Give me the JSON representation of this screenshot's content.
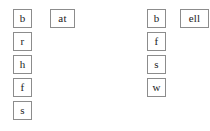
{
  "canvas": {
    "width": 210,
    "height": 131,
    "background_color": "#ffffff",
    "tile_border_color": "#8c8c8c",
    "tile_fill_color": "#ffffff",
    "text_color": "#1a1a1a"
  },
  "groups": [
    {
      "name": "at-word-family",
      "onset_column": {
        "x": 13,
        "y": 9,
        "pitch": 23,
        "tiles": [
          {
            "label": "b",
            "x": 13,
            "y": 9
          },
          {
            "label": "r",
            "x": 13,
            "y": 32
          },
          {
            "label": "h",
            "x": 13,
            "y": 55
          },
          {
            "label": "f",
            "x": 13,
            "y": 78
          },
          {
            "label": "s",
            "x": 13,
            "y": 101
          }
        ]
      },
      "rime_tile": {
        "label": "at",
        "x": 50,
        "y": 9
      }
    },
    {
      "name": "ell-word-family",
      "onset_column": {
        "x": 147,
        "y": 9,
        "pitch": 23,
        "tiles": [
          {
            "label": "b",
            "x": 147,
            "y": 9
          },
          {
            "label": "f",
            "x": 147,
            "y": 32
          },
          {
            "label": "s",
            "x": 147,
            "y": 55
          },
          {
            "label": "w",
            "x": 147,
            "y": 78
          }
        ]
      },
      "rime_tile": {
        "label": "ell",
        "x": 180,
        "y": 9
      }
    }
  ]
}
